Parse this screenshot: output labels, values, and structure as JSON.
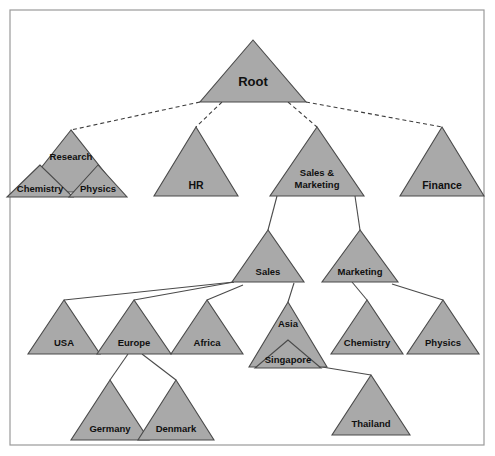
{
  "diagram": {
    "type": "tree-diagram",
    "colors": {
      "node_fill": "#a9a9a9",
      "node_stroke": "#4a4a4a",
      "frame_stroke": "#9a9a9a",
      "background": "#ffffff",
      "label_color": "#101010"
    },
    "frame": {
      "x": 10,
      "y": 10,
      "width": 474,
      "height": 435
    },
    "nodes": [
      {
        "id": "root",
        "label": "Root",
        "cx": 253,
        "base_y": 102,
        "half_width": 53,
        "height": 62,
        "label_y": 86,
        "font_size": 13
      },
      {
        "id": "research",
        "label": "Research",
        "cx": 71,
        "base_y": 192,
        "half_width": 49,
        "height": 62,
        "label_y": 160,
        "font_size": 9.5
      },
      {
        "id": "chemistry1",
        "label": "Chemistry",
        "cx": 40,
        "base_y": 197,
        "half_width": 33,
        "height": 32,
        "label_y": 192,
        "font_size": 9.5
      },
      {
        "id": "physics1",
        "label": "Physics",
        "cx": 98,
        "base_y": 197,
        "half_width": 29,
        "height": 32,
        "label_y": 192,
        "font_size": 9.5
      },
      {
        "id": "hr",
        "label": "HR",
        "cx": 196,
        "base_y": 196,
        "half_width": 42,
        "height": 69,
        "label_y": 189,
        "font_size": 10.5
      },
      {
        "id": "sales_mkt",
        "label": "Sales &|Marketing",
        "cx": 317,
        "base_y": 196,
        "half_width": 47,
        "height": 69,
        "label_y": 176,
        "font_size": 9.5
      },
      {
        "id": "finance",
        "label": "Finance",
        "cx": 442,
        "base_y": 196,
        "half_width": 42,
        "height": 69,
        "label_y": 189,
        "font_size": 10.5
      },
      {
        "id": "sales",
        "label": "Sales",
        "cx": 268,
        "base_y": 282,
        "half_width": 36,
        "height": 52,
        "label_y": 275,
        "font_size": 9.5
      },
      {
        "id": "marketing",
        "label": "Marketing",
        "cx": 360,
        "base_y": 282,
        "half_width": 38,
        "height": 52,
        "label_y": 275,
        "font_size": 9.5
      },
      {
        "id": "usa",
        "label": "USA",
        "cx": 64,
        "base_y": 354,
        "half_width": 36,
        "height": 54,
        "label_y": 346,
        "font_size": 9.5
      },
      {
        "id": "europe",
        "label": "Europe",
        "cx": 134,
        "base_y": 354,
        "half_width": 37,
        "height": 54,
        "label_y": 346,
        "font_size": 9.5
      },
      {
        "id": "africa",
        "label": "Africa",
        "cx": 207,
        "base_y": 354,
        "half_width": 36,
        "height": 54,
        "label_y": 346,
        "font_size": 9.5
      },
      {
        "id": "asia",
        "label": "Asia",
        "cx": 288,
        "base_y": 367,
        "half_width": 39,
        "height": 65,
        "label_y": 327,
        "font_size": 9.5
      },
      {
        "id": "singapore",
        "label": "Singapore",
        "cx": 288,
        "base_y": 368,
        "half_width": 33,
        "height": 28,
        "label_y": 363,
        "font_size": 9.5
      },
      {
        "id": "chemistry2",
        "label": "Chemistry",
        "cx": 367,
        "base_y": 354,
        "half_width": 36,
        "height": 54,
        "label_y": 346,
        "font_size": 9.5
      },
      {
        "id": "physics2",
        "label": "Physics",
        "cx": 443,
        "base_y": 354,
        "half_width": 36,
        "height": 54,
        "label_y": 346,
        "font_size": 9.5
      },
      {
        "id": "germany",
        "label": "Germany",
        "cx": 110,
        "base_y": 440,
        "half_width": 39,
        "height": 60,
        "label_y": 432,
        "font_size": 9.5
      },
      {
        "id": "denmark",
        "label": "Denmark",
        "cx": 176,
        "base_y": 440,
        "half_width": 38,
        "height": 60,
        "label_y": 432,
        "font_size": 9.5
      },
      {
        "id": "thailand",
        "label": "Thailand",
        "cx": 371,
        "base_y": 435,
        "half_width": 39,
        "height": 60,
        "label_y": 427,
        "font_size": 9.5
      }
    ],
    "edges": [
      {
        "from": "root",
        "to": "research",
        "style": "dashed",
        "x1": 200,
        "y1": 102,
        "x2": 71,
        "y2": 130
      },
      {
        "from": "root",
        "to": "hr",
        "style": "dashed",
        "x1": 222,
        "y1": 102,
        "x2": 196,
        "y2": 127
      },
      {
        "from": "root",
        "to": "sales_mkt",
        "style": "dashed",
        "x1": 288,
        "y1": 102,
        "x2": 317,
        "y2": 127
      },
      {
        "from": "root",
        "to": "finance",
        "style": "dashed",
        "x1": 306,
        "y1": 102,
        "x2": 442,
        "y2": 127
      },
      {
        "from": "research",
        "to": "chemistry1",
        "style": "solid",
        "x1": 71,
        "y1": 150,
        "x2": 46,
        "y2": 172
      },
      {
        "from": "research",
        "to": "physics1",
        "style": "solid",
        "x1": 78,
        "y1": 150,
        "x2": 96,
        "y2": 172
      },
      {
        "from": "sales_mkt",
        "to": "sales",
        "style": "solid",
        "x1": 277,
        "y1": 196,
        "x2": 268,
        "y2": 230
      },
      {
        "from": "sales_mkt",
        "to": "marketing",
        "style": "solid",
        "x1": 355,
        "y1": 196,
        "x2": 360,
        "y2": 230
      },
      {
        "from": "sales",
        "to": "usa",
        "style": "solid",
        "x1": 234,
        "y1": 282,
        "x2": 64,
        "y2": 300
      },
      {
        "from": "sales",
        "to": "europe",
        "style": "solid",
        "x1": 234,
        "y1": 282,
        "x2": 134,
        "y2": 300
      },
      {
        "from": "sales",
        "to": "africa",
        "style": "solid",
        "x1": 243,
        "y1": 285,
        "x2": 207,
        "y2": 300
      },
      {
        "from": "sales",
        "to": "asia",
        "style": "solid",
        "x1": 294,
        "y1": 283,
        "x2": 288,
        "y2": 302
      },
      {
        "from": "asia",
        "to": "singapore",
        "style": "solid",
        "x1": 288,
        "y1": 330,
        "x2": 288,
        "y2": 352
      },
      {
        "from": "singapore",
        "to": "thailand",
        "style": "solid",
        "x1": 316,
        "y1": 366,
        "x2": 371,
        "y2": 375
      },
      {
        "from": "europe",
        "to": "germany",
        "style": "solid",
        "x1": 128,
        "y1": 354,
        "x2": 110,
        "y2": 380
      },
      {
        "from": "europe",
        "to": "denmark",
        "style": "solid",
        "x1": 142,
        "y1": 354,
        "x2": 176,
        "y2": 380
      },
      {
        "from": "marketing",
        "to": "chemistry2",
        "style": "solid",
        "x1": 352,
        "y1": 282,
        "x2": 367,
        "y2": 300
      },
      {
        "from": "marketing",
        "to": "physics2",
        "style": "solid",
        "x1": 392,
        "y1": 284,
        "x2": 443,
        "y2": 300
      }
    ]
  }
}
